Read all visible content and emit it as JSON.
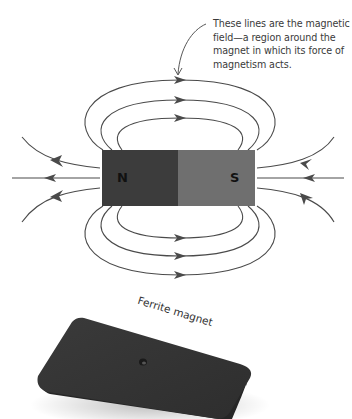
{
  "annotation": {
    "text": "These lines are the magnetic field—a region around the magnet in which its force of magnetism acts."
  },
  "bar_magnet": {
    "north_label": "N",
    "south_label": "S",
    "north_color": "#3c3c3c",
    "south_color": "#6f6f6f"
  },
  "field_lines": {
    "color": "#4a4a4a",
    "top_loops": 3,
    "bottom_loops": 3,
    "side_lines_per_pole": 3,
    "direction": "north-to-south"
  },
  "photo": {
    "label": "Ferrite magnet",
    "body_color": "#333333"
  }
}
